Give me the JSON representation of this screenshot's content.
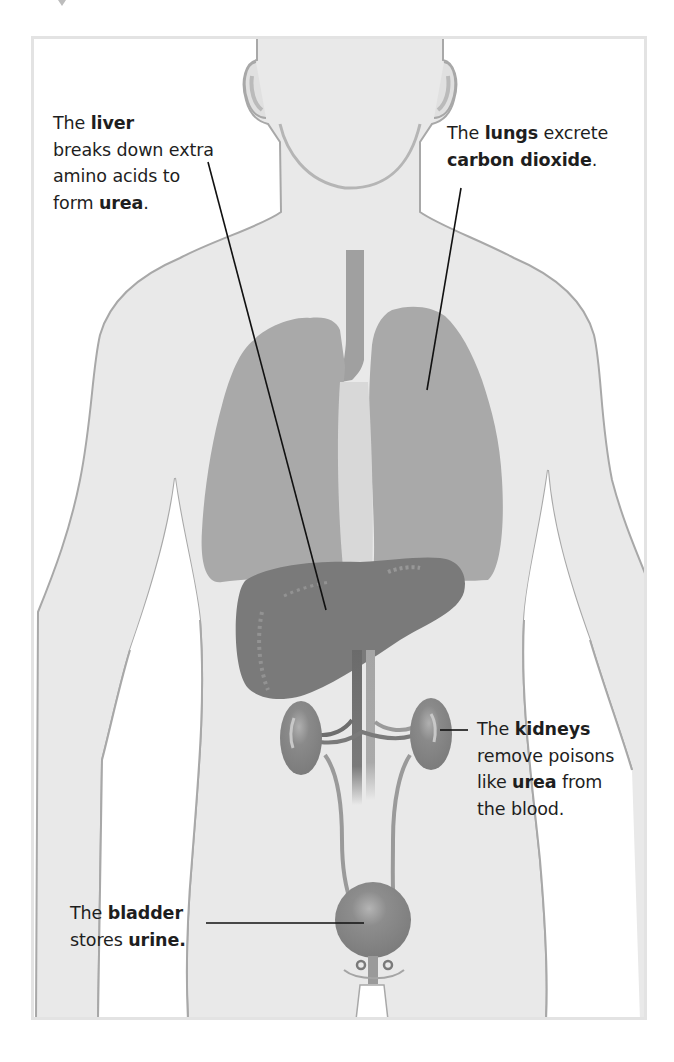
{
  "diagram": {
    "colors": {
      "body_fill": "#e9e9e9",
      "body_outline": "#a8a8a8",
      "lung_fill": "#a9a9a9",
      "liver_fill": "#7a7a7a",
      "kidney_fill": "#858585",
      "bladder_fill": "#8a8a8a",
      "vessel_dark": "#6b6b6b",
      "vessel_light": "#9a9a9a",
      "pointer_line": "#111111",
      "text": "#1e1e1e",
      "frame_border": "#e3e3e3"
    },
    "labels": {
      "liver": {
        "organ": "liver",
        "line1_pre": "The ",
        "line1_bold": "liver",
        "line2": "breaks down extra",
        "line3": "amino acids to",
        "line4_pre": "form ",
        "line4_bold": "urea",
        "line4_post": "."
      },
      "lungs": {
        "organ": "lungs",
        "line1_pre": "The ",
        "line1_bold": "lungs",
        "line1_post": " excrete",
        "line2_bold": "carbon dioxide",
        "line2_post": "."
      },
      "kidneys": {
        "organ": "kidneys",
        "line1_pre": "The ",
        "line1_bold": "kidneys",
        "line2": "remove poisons",
        "line3_pre": "like ",
        "line3_bold": "urea",
        "line3_post": " from",
        "line4": "the blood."
      },
      "bladder": {
        "organ": "bladder",
        "line1_pre": "The ",
        "line1_bold": "bladder",
        "line2_pre": "stores ",
        "line2_bold": "urine."
      }
    }
  }
}
